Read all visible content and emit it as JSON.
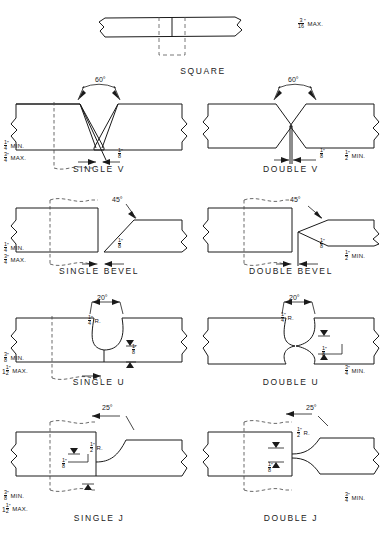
{
  "figure": {
    "units": "inches",
    "joint_count": 9
  },
  "joints": [
    {
      "id": "square",
      "caption": "SQUARE",
      "angle": null,
      "radius": null,
      "root_opening": null,
      "thickness_note": "3/16\" MAX.",
      "thickness_note_parts": {
        "whole": "",
        "num": "3",
        "den": "16",
        "suffix": "MAX."
      }
    },
    {
      "id": "single-v",
      "caption": "SINGLE V",
      "angle": "60°",
      "radius": null,
      "root_opening": {
        "num": "1",
        "den": "8"
      },
      "min": {
        "whole": "",
        "num": "1",
        "den": "4",
        "suffix": "MIN."
      },
      "max": {
        "whole": "",
        "num": "3",
        "den": "4",
        "suffix": "MAX."
      }
    },
    {
      "id": "double-v",
      "caption": "DOUBLE V",
      "angle": "60°",
      "radius": null,
      "root_opening": {
        "num": "1",
        "den": "8"
      },
      "min": {
        "whole": "",
        "num": "1",
        "den": "2",
        "suffix": "MIN."
      },
      "max": null
    },
    {
      "id": "single-bevel",
      "caption": "SINGLE BEVEL",
      "angle": "45°",
      "radius": null,
      "root_opening": {
        "num": "1",
        "den": "8"
      },
      "min": {
        "whole": "",
        "num": "1",
        "den": "4",
        "suffix": "MIN."
      },
      "max": {
        "whole": "",
        "num": "3",
        "den": "4",
        "suffix": "MAX."
      }
    },
    {
      "id": "double-bevel",
      "caption": "DOUBLE BEVEL",
      "angle": "45°",
      "radius": null,
      "root_opening": {
        "num": "1",
        "den": "8"
      },
      "min": {
        "whole": "",
        "num": "1",
        "den": "2",
        "suffix": "MIN."
      },
      "max": null
    },
    {
      "id": "single-u",
      "caption": "SINGLE U",
      "angle": "20°",
      "radius": {
        "num": "1",
        "den": "4",
        "suffix": "R."
      },
      "root_opening": {
        "num": "1",
        "den": "8"
      },
      "min": {
        "whole": "",
        "num": "3",
        "den": "8",
        "suffix": "MIN."
      },
      "max": {
        "whole": "1",
        "num": "1",
        "den": "2",
        "suffix": "MAX."
      }
    },
    {
      "id": "double-u",
      "caption": "DOUBLE U",
      "angle": "20°",
      "radius": {
        "num": "1",
        "den": "4",
        "suffix": "R."
      },
      "root_opening": {
        "num": "1",
        "den": "8"
      },
      "min": {
        "whole": "",
        "num": "3",
        "den": "4",
        "suffix": "MIN."
      },
      "max": null
    },
    {
      "id": "single-j",
      "caption": "SINGLE J",
      "angle": "25°",
      "radius": {
        "num": "1",
        "den": "2",
        "suffix": "R."
      },
      "root_opening": {
        "num": "1",
        "den": "8"
      },
      "min": {
        "whole": "",
        "num": "3",
        "den": "8",
        "suffix": "MIN."
      },
      "max": {
        "whole": "1",
        "num": "1",
        "den": "2",
        "suffix": "MAX."
      }
    },
    {
      "id": "double-j",
      "caption": "DOUBLE J",
      "angle": "25°",
      "radius": {
        "num": "1",
        "den": "2",
        "suffix": "R."
      },
      "root_opening": {
        "num": "1",
        "den": "8"
      },
      "min": {
        "whole": "",
        "num": "3",
        "den": "4",
        "suffix": "MIN."
      },
      "max": null
    }
  ],
  "captions": {
    "square": "SQUARE",
    "single_v": "SINGLE V",
    "double_v": "DOUBLE V",
    "single_bevel": "SINGLE BEVEL",
    "double_bevel": "DOUBLE BEVEL",
    "single_u": "SINGLE U",
    "double_u": "DOUBLE U",
    "single_j": "SINGLE J",
    "double_j": "DOUBLE J"
  },
  "angles": {
    "v": "60°",
    "bevel": "45°",
    "u": "20°",
    "j": "25°"
  },
  "suffix": {
    "min": "MIN.",
    "max": "MAX.",
    "radius": "R."
  },
  "numbers": {
    "one": "1",
    "two": "2",
    "three": "3",
    "four": "4",
    "eight": "8",
    "sixteen": "16"
  }
}
